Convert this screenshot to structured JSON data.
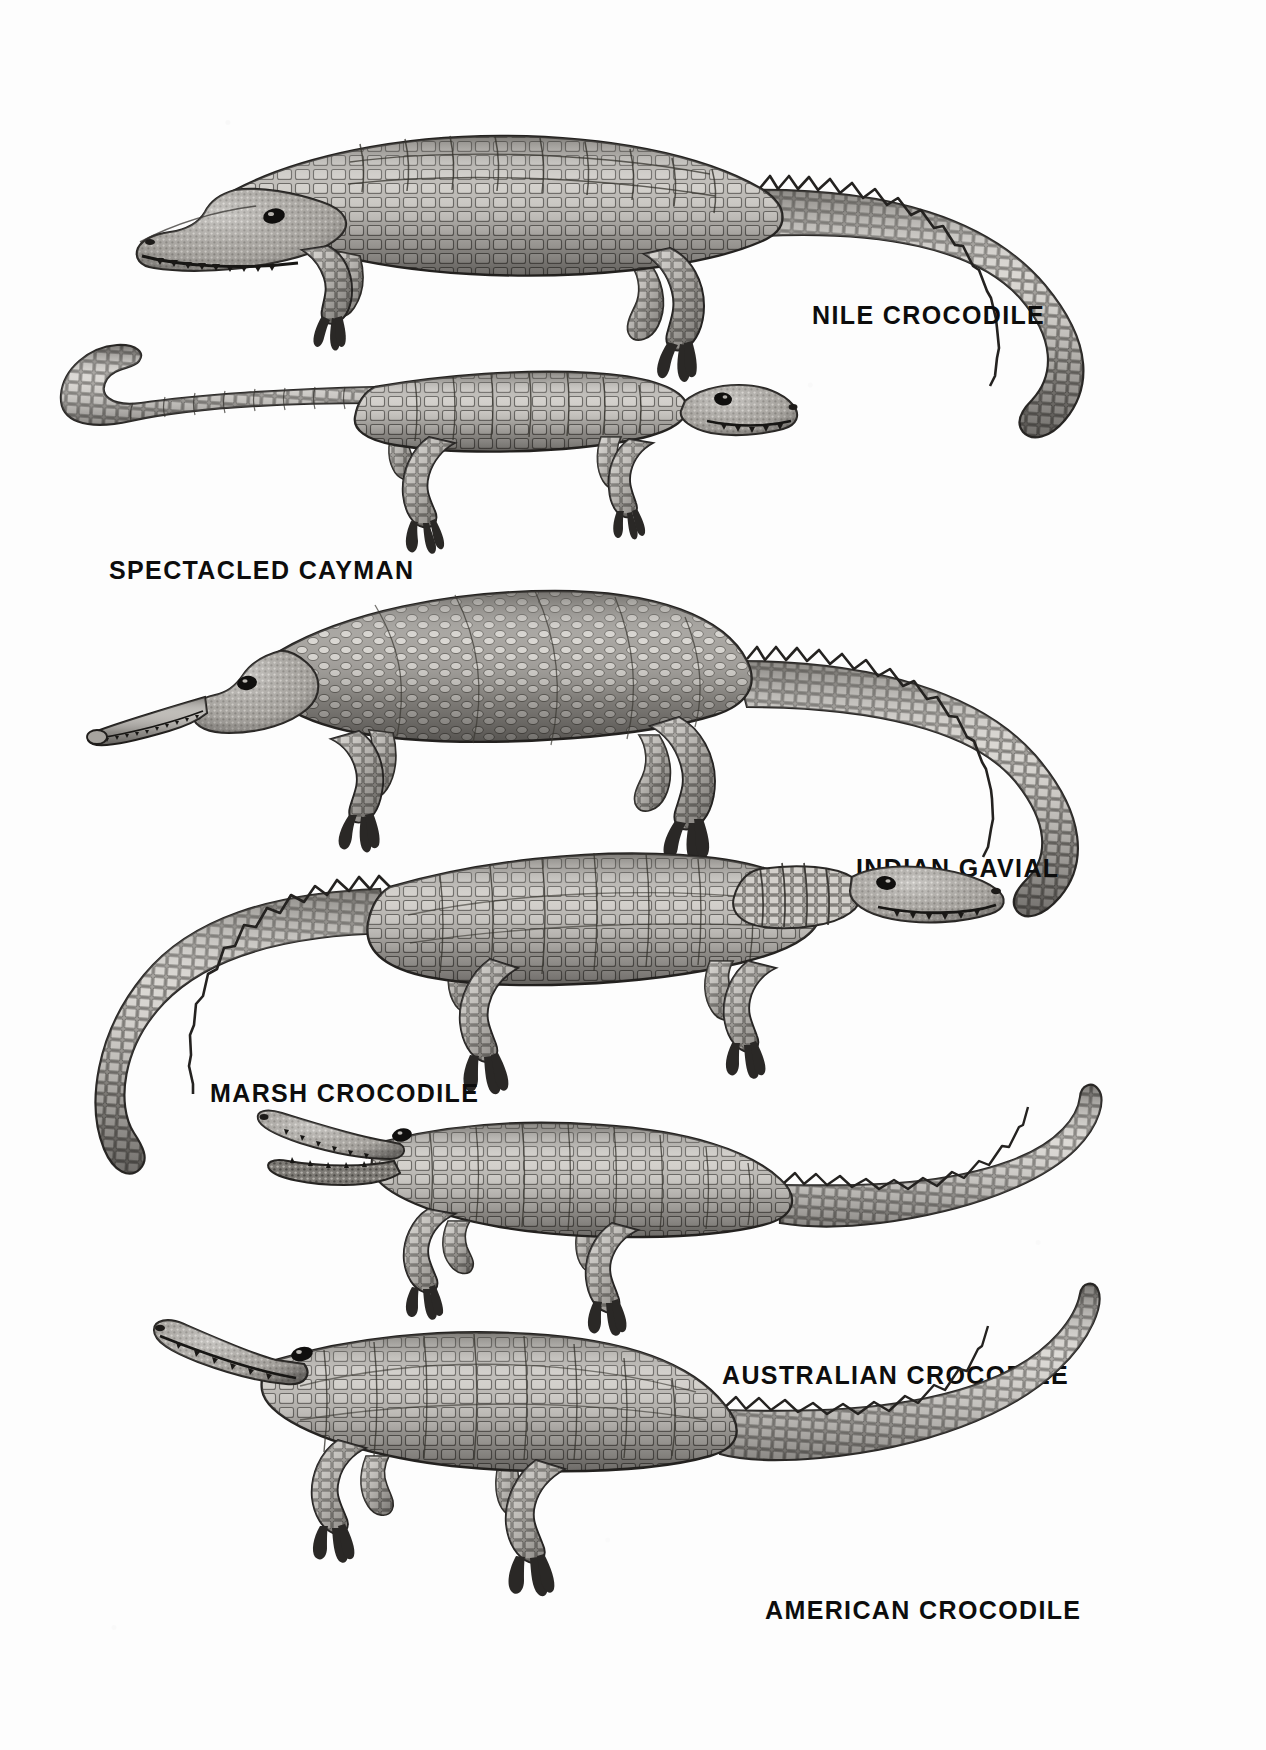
{
  "plate": {
    "kind": "natural-history-illustration-plate",
    "medium": "grayscale halftone engraving",
    "background_color": "#fdfdfd",
    "ink_color": "#0d0d0d",
    "width": 1266,
    "height": 1750
  },
  "specimens": [
    {
      "id": "nile-crocodile",
      "label": "NILE CROCODILE",
      "label_x": 812,
      "label_y": 303,
      "orientation": "head-left",
      "pose": "standing, long tail curving down and right",
      "tone_light": "#d8d6d2",
      "tone_mid": "#8e8b87",
      "tone_dark": "#3a3835"
    },
    {
      "id": "spectacled-cayman",
      "label": "SPECTACLED CAYMAN",
      "label_x": 109,
      "label_y": 558,
      "orientation": "head-right",
      "pose": "standing, tail curling up at left",
      "tone_light": "#dbd9d5",
      "tone_mid": "#96938e",
      "tone_dark": "#3d3b38"
    },
    {
      "id": "indian-gavial",
      "label": "INDIAN GAVIAL",
      "label_x": 856,
      "label_y": 856,
      "orientation": "head-left",
      "pose": "standing, very long narrow snout, tail sweeping right and down",
      "tone_light": "#d6d4d0",
      "tone_mid": "#8b8884",
      "tone_dark": "#383634"
    },
    {
      "id": "marsh-crocodile",
      "label": "MARSH CROCODILE",
      "label_x": 210,
      "label_y": 1081,
      "orientation": "head-right",
      "pose": "standing, broad snout, tail curving down to the left",
      "tone_light": "#d9d7d3",
      "tone_mid": "#918e8a",
      "tone_dark": "#3b3936"
    },
    {
      "id": "australian-crocodile",
      "label": "AUSTRALIAN CROCODILE",
      "label_x": 722,
      "label_y": 1363,
      "orientation": "head-left",
      "pose": "standing, jaws open, slender tail sweeping right",
      "tone_light": "#dad8d4",
      "tone_mid": "#8f8c88",
      "tone_dark": "#393735"
    },
    {
      "id": "american-crocodile",
      "label": "AMERICAN CROCODILE",
      "label_x": 765,
      "label_y": 1598,
      "orientation": "head-left",
      "pose": "standing, long body, tail sweeping up and to the right",
      "tone_light": "#d7d5d1",
      "tone_mid": "#8d8a86",
      "tone_dark": "#363431"
    }
  ]
}
